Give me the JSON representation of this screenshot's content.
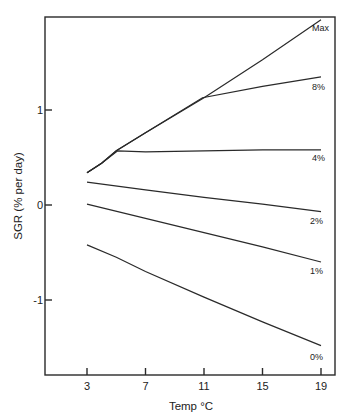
{
  "chart_data": {
    "type": "line",
    "title": "",
    "xlabel": "Temp °C",
    "ylabel": "SGR (% per day)",
    "xlim": [
      0.0,
      20.0
    ],
    "ylim": [
      -1.8,
      2.0
    ],
    "x_ticks": [
      3,
      7,
      11,
      15,
      19
    ],
    "y_ticks": [
      1,
      0,
      -1
    ],
    "grid": false,
    "legend": "inline labels at right end of each line",
    "series": [
      {
        "name": "Max",
        "x": [
          3,
          4,
          5,
          7,
          11,
          15,
          19
        ],
        "y": [
          0.34,
          0.44,
          0.57,
          0.76,
          1.13,
          1.53,
          1.95
        ]
      },
      {
        "name": "8%",
        "x": [
          3,
          4,
          5,
          7,
          10.9,
          15,
          19
        ],
        "y": [
          0.34,
          0.44,
          0.57,
          0.76,
          1.13,
          1.25,
          1.35
        ]
      },
      {
        "name": "4%",
        "x": [
          3,
          4,
          5.1,
          7,
          11,
          15,
          19
        ],
        "y": [
          0.34,
          0.44,
          0.57,
          0.56,
          0.57,
          0.58,
          0.58
        ]
      },
      {
        "name": "2%",
        "x": [
          3,
          7,
          11,
          15,
          19
        ],
        "y": [
          0.24,
          0.16,
          0.08,
          0.01,
          -0.07
        ]
      },
      {
        "name": "1%",
        "x": [
          3,
          7,
          11,
          15,
          19
        ],
        "y": [
          0.01,
          -0.14,
          -0.29,
          -0.44,
          -0.6
        ]
      },
      {
        "name": "0%",
        "x": [
          3,
          5,
          7,
          11,
          15,
          19
        ],
        "y": [
          -0.42,
          -0.55,
          -0.7,
          -0.97,
          -1.23,
          -1.48
        ]
      }
    ]
  },
  "labels": {
    "xlabel": "Temp °C",
    "ylabel": "SGR (% per day)",
    "x_ticks": [
      "3",
      "7",
      "11",
      "15",
      "19"
    ],
    "y_ticks": [
      "1",
      "0",
      "-1"
    ],
    "series": [
      "Max",
      "8%",
      "4%",
      "2%",
      "1%",
      "0%"
    ]
  }
}
